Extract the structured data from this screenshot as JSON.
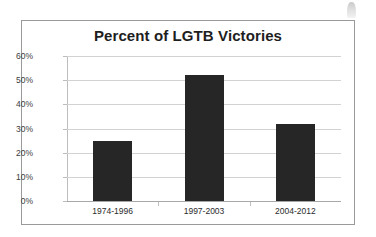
{
  "chart_data": {
    "type": "bar",
    "title": "Percent of LGTB Victories",
    "xlabel": "",
    "ylabel": "",
    "categories": [
      "1974-1996",
      "1997-2003",
      "2004-2012"
    ],
    "values": [
      25,
      52,
      32
    ],
    "ylim": [
      0,
      60
    ],
    "ytick_labels": [
      "0%",
      "10%",
      "20%",
      "30%",
      "40%",
      "50%",
      "60%"
    ],
    "ytick_values": [
      0,
      10,
      20,
      30,
      40,
      50,
      60
    ],
    "grid": "horizontal",
    "legend": "none",
    "bar_color": "#262626",
    "gridline_color": "#d2d2d2",
    "frame_color": "#9a9a9a",
    "title_color": "#1e1e1e",
    "background": "#ffffff"
  },
  "artifact": {
    "name": "scan-smudge"
  }
}
